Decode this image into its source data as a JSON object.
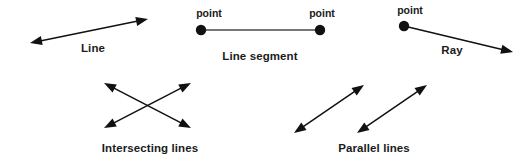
{
  "canvas": {
    "width": 527,
    "height": 165,
    "background": "#ffffff",
    "ink_color": "#111111",
    "label_color": "#1b1b1b",
    "segment_color": "#777777"
  },
  "figures": {
    "line": {
      "label": "Line",
      "label_x": 93,
      "label_y": 52,
      "start": {
        "x": 30,
        "y": 43
      },
      "end": {
        "x": 148,
        "y": 19
      },
      "arrow_start": true,
      "arrow_end": true,
      "endpoint_dots": 0
    },
    "line_segment": {
      "label": "Line segment",
      "label_x": 260,
      "label_y": 60,
      "start": {
        "x": 201,
        "y": 30
      },
      "end": {
        "x": 320,
        "y": 30
      },
      "arrow_start": false,
      "arrow_end": false,
      "endpoint_dots": 2,
      "point_label_left": "point",
      "point_label_left_x": 209,
      "point_label_left_y": 17,
      "point_label_right": "point",
      "point_label_right_x": 322,
      "point_label_right_y": 17
    },
    "ray": {
      "label": "Ray",
      "label_x": 452,
      "label_y": 54,
      "start": {
        "x": 404,
        "y": 26
      },
      "end": {
        "x": 513,
        "y": 52
      },
      "arrow_start": false,
      "arrow_end": true,
      "endpoint_dots": 1,
      "point_label": "point",
      "point_label_x": 410,
      "point_label_y": 14
    },
    "intersecting_lines": {
      "label": "Intersecting lines",
      "label_x": 150,
      "label_y": 152,
      "line_a": {
        "start": {
          "x": 104,
          "y": 83
        },
        "end": {
          "x": 191,
          "y": 128
        },
        "arrow_start": true,
        "arrow_end": true
      },
      "line_b": {
        "start": {
          "x": 104,
          "y": 128
        },
        "end": {
          "x": 191,
          "y": 83
        },
        "arrow_start": true,
        "arrow_end": true
      }
    },
    "parallel_lines": {
      "label": "Parallel lines",
      "label_x": 374,
      "label_y": 152,
      "line_a": {
        "start": {
          "x": 294,
          "y": 133
        },
        "end": {
          "x": 364,
          "y": 85
        },
        "arrow_start": true,
        "arrow_end": true
      },
      "line_b": {
        "start": {
          "x": 357,
          "y": 133
        },
        "end": {
          "x": 427,
          "y": 85
        },
        "arrow_start": true,
        "arrow_end": true
      }
    }
  }
}
